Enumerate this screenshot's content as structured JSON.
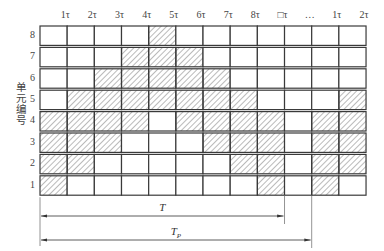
{
  "diagram": {
    "y_axis_label": "单元编号",
    "x_ticks": [
      "1τ",
      "2τ",
      "3τ",
      "4τ",
      "5τ",
      "6τ",
      "7τ",
      "8τ",
      "□τ",
      "…",
      "1τ",
      "2τ"
    ],
    "rows": [
      {
        "label": "8",
        "filled": [
          4
        ]
      },
      {
        "label": "7",
        "filled": [
          3,
          4,
          5
        ]
      },
      {
        "label": "6",
        "filled": [
          2,
          3,
          4,
          5,
          6
        ]
      },
      {
        "label": "5",
        "filled": [
          1,
          2,
          3,
          4,
          5,
          6,
          7,
          11
        ]
      },
      {
        "label": "4",
        "filled": [
          0,
          1,
          2,
          3,
          5,
          6,
          7,
          8,
          10,
          11
        ]
      },
      {
        "label": "3",
        "filled": [
          0,
          1,
          2,
          6,
          7,
          8,
          10,
          11
        ]
      },
      {
        "label": "2",
        "filled": [
          0,
          1,
          7,
          8,
          10,
          11
        ]
      },
      {
        "label": "1",
        "filled": [
          0,
          8,
          10
        ]
      }
    ],
    "columns": 12,
    "intervals": [
      {
        "label": "T",
        "sub": "",
        "start_col": 0,
        "end_col": 9
      },
      {
        "label": "T",
        "sub": "P",
        "start_col": 0,
        "end_col": 10
      }
    ],
    "colors": {
      "line": "#3a3a3a",
      "hatch": "#555555",
      "background": "#ffffff"
    }
  }
}
